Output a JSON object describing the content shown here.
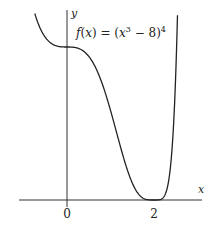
{
  "chart_data": {
    "type": "line",
    "title": "",
    "function_label": "f(x) = (x^3 - 8)^4",
    "xlabel": "x",
    "ylabel": "y",
    "x_ticks": [
      {
        "value": 0,
        "label": "0"
      },
      {
        "value": 2,
        "label": "2"
      }
    ],
    "xlim": [
      -1.1,
      3.1
    ],
    "ylim": [
      0,
      5000
    ],
    "grid": false,
    "legend": "none",
    "series": [
      {
        "name": "f(x) = (x^3 - 8)^4",
        "x": [
          -0.74,
          -0.6,
          -0.4,
          -0.2,
          0,
          0.2,
          0.4,
          0.6,
          0.8,
          1.0,
          1.2,
          1.4,
          1.6,
          1.8,
          2.0,
          2.1,
          2.2,
          2.3,
          2.4,
          2.54
        ],
        "y": [
          4991,
          4506,
          4208,
          4109,
          4096,
          4080,
          3936,
          3505,
          2716,
          2401,
          1454,
          768,
          293,
          57,
          0,
          2,
          34,
          205,
          830,
          4980
        ]
      }
    ],
    "annotations": {
      "minimum": {
        "x": 2,
        "y": 0
      },
      "y_intercept": {
        "x": 0,
        "y": 4096
      }
    }
  },
  "labels": {
    "y_axis": "y",
    "x_axis": "x",
    "tick_0": "0",
    "tick_2": "2",
    "formula_prefix": "f(x) = (x",
    "formula_exp3": "3",
    "formula_mid": " − 8)",
    "formula_exp4": "4"
  }
}
